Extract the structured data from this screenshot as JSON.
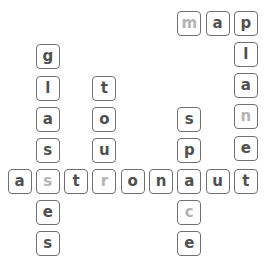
{
  "puzzle": {
    "type": "crossword-letter-grid",
    "words": [
      {
        "word": "map",
        "direction": "across"
      },
      {
        "word": "plane",
        "direction": "down"
      },
      {
        "word": "glasses",
        "direction": "down"
      },
      {
        "word": "tour",
        "direction": "down"
      },
      {
        "word": "space",
        "direction": "down"
      },
      {
        "word": "astronaut",
        "direction": "across"
      },
      {
        "word": "planet",
        "direction": "down"
      }
    ],
    "colors": {
      "letter": "#505050",
      "hint_letter": "#b3b3b3",
      "border": "#6f6f6f"
    },
    "tiles": [
      {
        "letter": "m",
        "col": 6,
        "row": 0,
        "hint": true
      },
      {
        "letter": "a",
        "col": 7,
        "row": 0,
        "hint": false
      },
      {
        "letter": "p",
        "col": 8,
        "row": 0,
        "hint": false
      },
      {
        "letter": "l",
        "col": 8,
        "row": 1,
        "hint": false
      },
      {
        "letter": "a",
        "col": 8,
        "row": 2,
        "hint": false
      },
      {
        "letter": "n",
        "col": 8,
        "row": 3,
        "hint": true
      },
      {
        "letter": "e",
        "col": 8,
        "row": 4,
        "hint": false
      },
      {
        "letter": "g",
        "col": 1,
        "row": 1,
        "hint": false
      },
      {
        "letter": "l",
        "col": 1,
        "row": 2,
        "hint": false
      },
      {
        "letter": "a",
        "col": 1,
        "row": 3,
        "hint": false
      },
      {
        "letter": "s",
        "col": 1,
        "row": 4,
        "hint": false
      },
      {
        "letter": "e",
        "col": 1,
        "row": 6,
        "hint": false
      },
      {
        "letter": "s",
        "col": 1,
        "row": 7,
        "hint": false
      },
      {
        "letter": "t",
        "col": 3,
        "row": 2,
        "hint": false
      },
      {
        "letter": "o",
        "col": 3,
        "row": 3,
        "hint": false
      },
      {
        "letter": "u",
        "col": 3,
        "row": 4,
        "hint": false
      },
      {
        "letter": "s",
        "col": 6,
        "row": 3,
        "hint": false
      },
      {
        "letter": "p",
        "col": 6,
        "row": 4,
        "hint": false
      },
      {
        "letter": "c",
        "col": 6,
        "row": 6,
        "hint": true
      },
      {
        "letter": "e",
        "col": 6,
        "row": 7,
        "hint": false
      },
      {
        "letter": "a",
        "col": 0,
        "row": 5,
        "hint": false
      },
      {
        "letter": "s",
        "col": 1,
        "row": 5,
        "hint": true
      },
      {
        "letter": "t",
        "col": 2,
        "row": 5,
        "hint": false
      },
      {
        "letter": "r",
        "col": 3,
        "row": 5,
        "hint": true
      },
      {
        "letter": "o",
        "col": 4,
        "row": 5,
        "hint": false
      },
      {
        "letter": "n",
        "col": 5,
        "row": 5,
        "hint": false
      },
      {
        "letter": "a",
        "col": 6,
        "row": 5,
        "hint": false
      },
      {
        "letter": "u",
        "col": 7,
        "row": 5,
        "hint": false
      },
      {
        "letter": "t",
        "col": 8,
        "row": 5,
        "hint": false
      }
    ]
  }
}
